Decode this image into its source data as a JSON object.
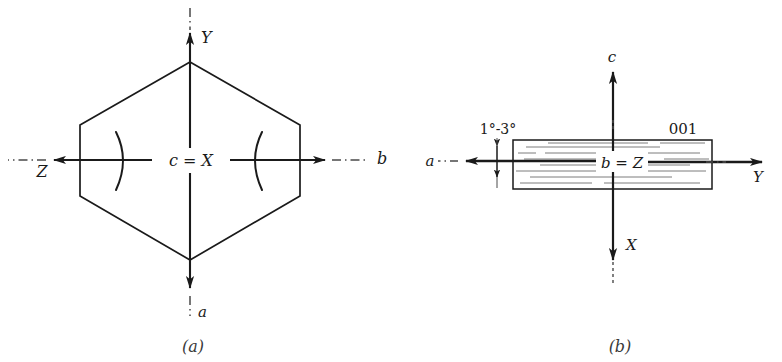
{
  "figure": {
    "title_visible": false,
    "background_color": "#ffffff",
    "ink_color": "#1a1a1a",
    "panels": [
      {
        "id": "panel-a",
        "caption": "(a)",
        "shape": "hexagon",
        "description_axes": [
          {
            "name": "crystallographic-axis-b",
            "label": "b",
            "direction": "right"
          },
          {
            "name": "optical-axis-Z",
            "label": "Z",
            "direction": "left"
          },
          {
            "name": "optical-axis-Y",
            "label": "Y",
            "direction": "up"
          },
          {
            "name": "crystallographic-axis-a",
            "label": "a",
            "direction": "down"
          }
        ],
        "center_label": "c = X",
        "cleavage_marks": [
          ")",
          "("
        ]
      },
      {
        "id": "panel-b",
        "caption": "(b)",
        "shape": "rectangle-striated",
        "description_axes": [
          {
            "name": "crystallographic-axis-c",
            "label": "c",
            "direction": "up"
          },
          {
            "name": "optical-axis-X",
            "label": "X",
            "direction": "down"
          },
          {
            "name": "crystallographic-axis-a",
            "label": "a",
            "direction": "left"
          },
          {
            "name": "optical-axis-Y",
            "label": "Y",
            "direction": "right"
          }
        ],
        "center_label": "b = Z",
        "face_index_label": "001",
        "angle_label": "1°-3°"
      }
    ]
  },
  "panel_a": {
    "axis_b": "b",
    "axis_z": "Z",
    "axis_y": "Y",
    "axis_a": "a",
    "center": "c = X",
    "cleavage_left": ")",
    "cleavage_right": "(",
    "caption": "(a)"
  },
  "panel_b": {
    "axis_c": "c",
    "axis_x": "X",
    "axis_a": "a",
    "axis_y": "Y",
    "center": "b = Z",
    "face_index": "001",
    "angle": "1°-3°",
    "caption": "(b)"
  }
}
